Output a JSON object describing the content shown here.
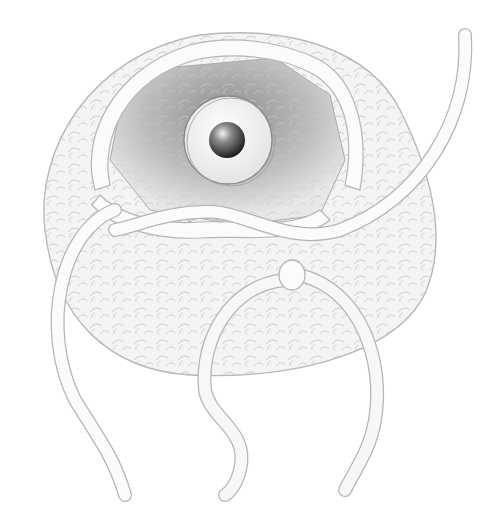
{
  "illustration": {
    "subject": "Crocheted amigurumi shell with a safety eye inserted and yarn tails hanging",
    "colors": {
      "background": "#ffffff",
      "outline": "#b8b8b8",
      "fabric": "#f2f2f2",
      "inner_shadow": "#9a9a9a",
      "eye_washer": "#fafafa",
      "eye_pupil": "#2a2a2a",
      "yarn": "#fbfbfb"
    },
    "elements": [
      {
        "name": "crochet-shell",
        "label": "Crochet shell"
      },
      {
        "name": "inner-cavity",
        "label": "Inner cavity"
      },
      {
        "name": "safety-eye",
        "label": "Safety eye"
      },
      {
        "name": "edge-stitches",
        "label": "Edge stitches"
      },
      {
        "name": "yarn-tail-right",
        "label": "Yarn tail (right)"
      },
      {
        "name": "yarn-tail-left",
        "label": "Yarn tail (left)"
      },
      {
        "name": "yarn-loop-knot",
        "label": "Yarn loop knot"
      }
    ]
  }
}
